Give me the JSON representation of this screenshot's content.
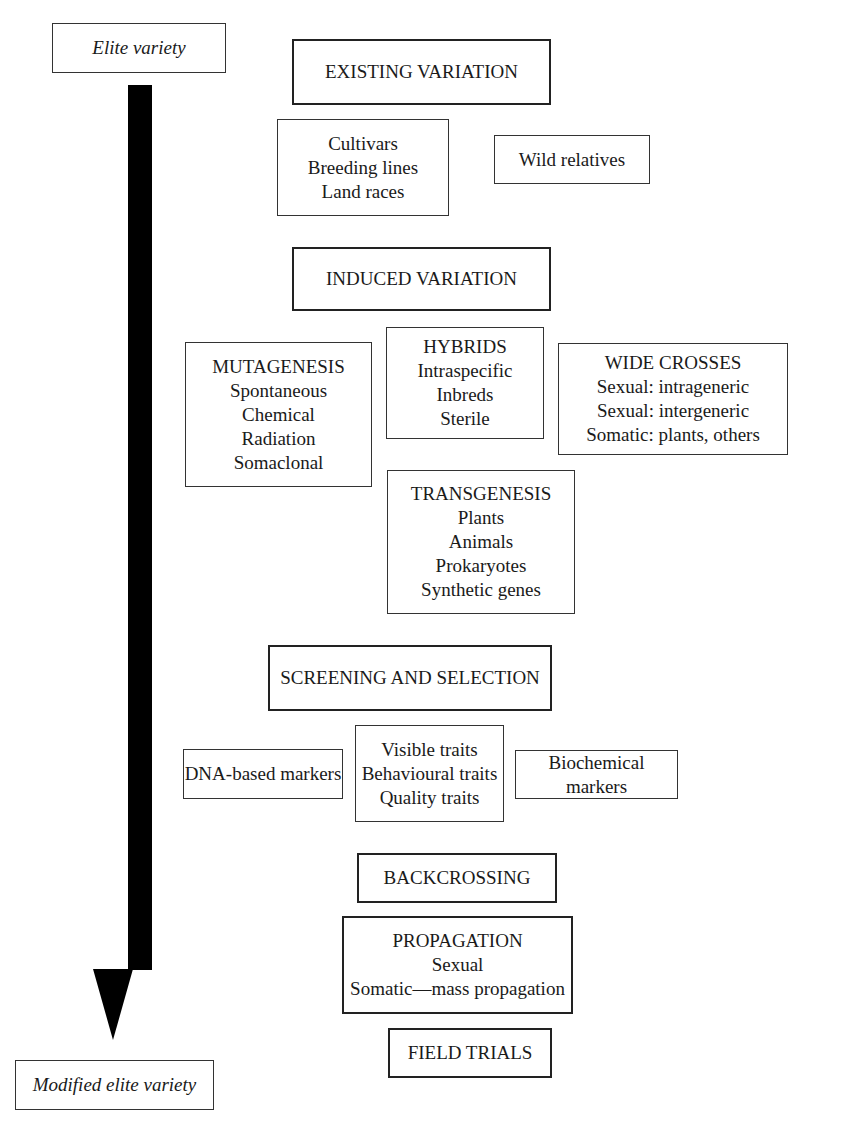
{
  "start": {
    "label": "Elite variety"
  },
  "end": {
    "label": "Modified elite variety"
  },
  "existing": {
    "title": "EXISTING VARIATION",
    "sources": {
      "lines": [
        "Cultivars",
        "Breeding lines",
        "Land races"
      ]
    },
    "wild": {
      "label": "Wild relatives"
    }
  },
  "induced": {
    "title": "INDUCED VARIATION",
    "mutagenesis": {
      "lines": [
        "MUTAGENESIS",
        "Spontaneous",
        "Chemical",
        "Radiation",
        "Somaclonal"
      ]
    },
    "hybrids": {
      "lines": [
        "HYBRIDS",
        "Intraspecific",
        "Inbreds",
        "Sterile"
      ]
    },
    "wide_crosses": {
      "lines": [
        "WIDE CROSSES",
        "Sexual: intrageneric",
        "Sexual: intergeneric",
        "Somatic: plants, others"
      ]
    },
    "transgenesis": {
      "lines": [
        "TRANSGENESIS",
        "Plants",
        "Animals",
        "Prokaryotes",
        "Synthetic genes"
      ]
    }
  },
  "screening": {
    "title": "SCREENING AND SELECTION",
    "dna": {
      "label": "DNA-based markers"
    },
    "traits": {
      "lines": [
        "Visible traits",
        "Behavioural traits",
        "Quality traits"
      ]
    },
    "biochem": {
      "label": "Biochemical markers"
    }
  },
  "backcrossing": {
    "title": "BACKCROSSING"
  },
  "propagation": {
    "lines": [
      "PROPAGATION",
      "Sexual",
      "Somatic—mass propagation"
    ]
  },
  "field_trials": {
    "title": "FIELD TRIALS"
  }
}
